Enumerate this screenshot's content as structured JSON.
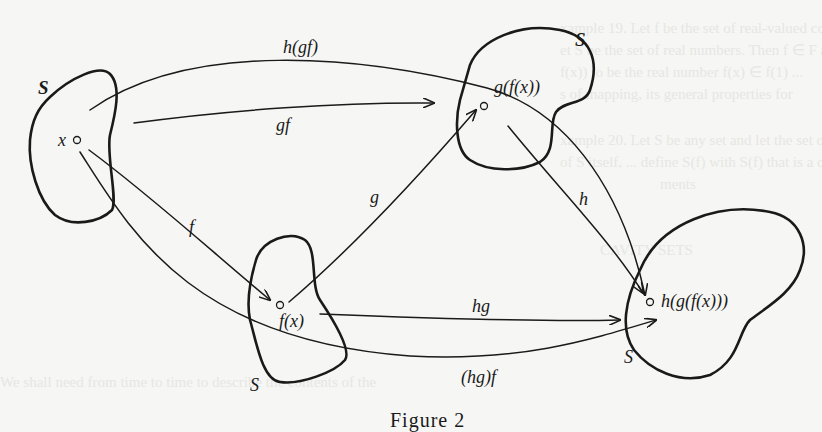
{
  "figure": {
    "caption": "Figure 2",
    "sets": [
      {
        "id": "domain",
        "label": "S"
      },
      {
        "id": "fx-set",
        "label": "S"
      },
      {
        "id": "gfx-set",
        "label": "S"
      },
      {
        "id": "hgfx-set",
        "label": "S"
      }
    ],
    "points": {
      "x": "x",
      "fx": "f(x)",
      "gfx": "g(f(x))",
      "hgfx": "h(g(f(x)))"
    },
    "arrows": {
      "f": "f",
      "g": "g",
      "h": "h",
      "gf": "gf",
      "hg": "hg",
      "h_gf": "h(gf)",
      "hg_f": "(hg)f"
    }
  }
}
